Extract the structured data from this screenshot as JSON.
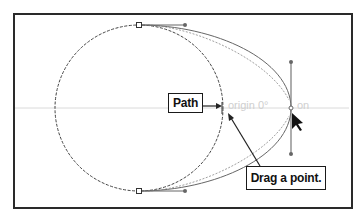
{
  "diagram": {
    "callouts": {
      "path_label": "Path",
      "drag_label": "Drag a point."
    },
    "smart_guide": {
      "label_left": "origin 0°",
      "label_right": "on"
    },
    "elements": {
      "circle": {
        "cx": 139,
        "cy": 108,
        "rx": 84,
        "ry": 83,
        "style": "dashed"
      },
      "anchors": [
        {
          "name": "top-anchor",
          "x": 139,
          "y": 25,
          "handle_end": [
            185,
            25
          ]
        },
        {
          "name": "bottom-anchor",
          "x": 139,
          "y": 191,
          "handle_end": [
            185,
            191
          ]
        },
        {
          "name": "dragged-anchor",
          "x": 291,
          "y": 108,
          "handle_top": [
            291,
            62
          ],
          "handle_bottom": [
            291,
            154
          ]
        }
      ],
      "guide_line_y": 108
    },
    "colors": {
      "frame": "#2a2a2a",
      "path": "#555555",
      "handle": "#777777",
      "guide": "#d8d8d8",
      "text": "#111111"
    }
  }
}
